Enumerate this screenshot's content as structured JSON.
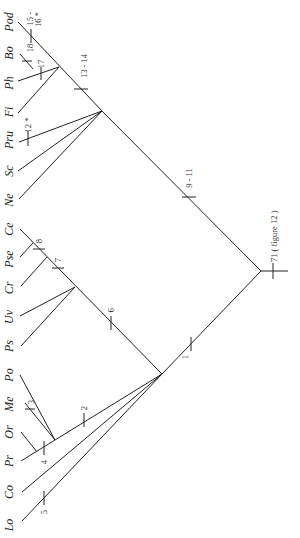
{
  "diagram": {
    "type": "cladogram",
    "orientation": "rotated-90",
    "taxa": [
      {
        "label": "Pod",
        "x": 11,
        "y": 22
      },
      {
        "label": "Bo",
        "x": 11,
        "y": 53
      },
      {
        "label": "Ph",
        "x": 11,
        "y": 83
      },
      {
        "label": "Fi",
        "x": 11,
        "y": 112
      },
      {
        "label": "Pru",
        "x": 11,
        "y": 140
      },
      {
        "label": "Sc",
        "x": 11,
        "y": 171
      },
      {
        "label": "Ne",
        "x": 11,
        "y": 200
      },
      {
        "label": "Ce",
        "x": 11,
        "y": 229
      },
      {
        "label": "Pse",
        "x": 11,
        "y": 259
      },
      {
        "label": "Cr",
        "x": 11,
        "y": 288
      },
      {
        "label": "Uv",
        "x": 11,
        "y": 317
      },
      {
        "label": "Ps",
        "x": 11,
        "y": 346
      },
      {
        "label": "Po",
        "x": 11,
        "y": 375
      },
      {
        "label": "Me",
        "x": 11,
        "y": 404
      },
      {
        "label": "Or",
        "x": 11,
        "y": 432
      },
      {
        "label": "Pr",
        "x": 11,
        "y": 461
      },
      {
        "label": "Co",
        "x": 11,
        "y": 492
      },
      {
        "label": "Lo",
        "x": 11,
        "y": 525
      }
    ],
    "character_labels": [
      {
        "text": "15 -",
        "x": 93,
        "y": 14
      },
      {
        "text": "16 *",
        "x": 100,
        "y": 14
      },
      {
        "text": "18",
        "x": 34,
        "y": 57
      },
      {
        "text": "17",
        "x": 48,
        "y": 68
      },
      {
        "text": "13 - 14",
        "x": 88,
        "y": 83
      },
      {
        "text": "12 *",
        "x": 31,
        "y": 127
      },
      {
        "text": "9 - 11",
        "x": 192,
        "y": 168
      },
      {
        "text": "71 ( figure 12 )",
        "x": 276,
        "y": 267
      },
      {
        "text": "8",
        "x": 45,
        "y": 243
      },
      {
        "text": "7",
        "x": 64,
        "y": 262
      },
      {
        "text": "6",
        "x": 117,
        "y": 317
      },
      {
        "text": "1",
        "x": 184,
        "y": 350
      },
      {
        "text": "2",
        "x": 90,
        "y": 414
      },
      {
        "text": "3",
        "x": 34,
        "y": 403
      },
      {
        "text": "4",
        "x": 47,
        "y": 460
      },
      {
        "text": "5",
        "x": 47,
        "y": 510
      }
    ]
  }
}
